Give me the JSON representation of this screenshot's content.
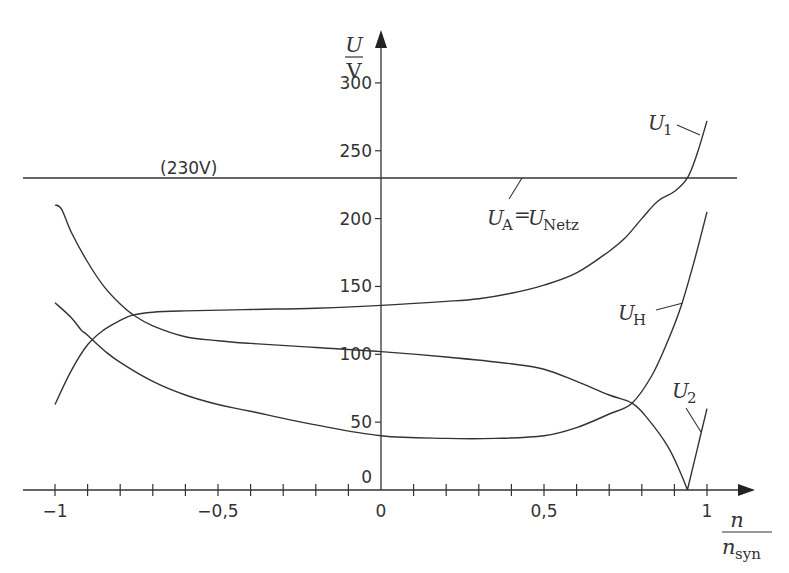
{
  "chart_data": {
    "type": "line",
    "title": "",
    "xlabel": {
      "numerator": "n",
      "denominator": "n",
      "denominator_sub": "syn"
    },
    "ylabel": {
      "numerator": "U",
      "denominator": "V"
    },
    "xlim": [
      -1.08,
      1.15
    ],
    "ylim": [
      0,
      320
    ],
    "grid": false,
    "x_ticks": [
      -1,
      -0.9,
      -0.8,
      -0.7,
      -0.6,
      -0.5,
      -0.4,
      -0.3,
      -0.2,
      -0.1,
      0,
      0.1,
      0.2,
      0.3,
      0.4,
      0.5,
      0.6,
      0.7,
      0.8,
      0.9,
      1
    ],
    "x_tick_labels": [
      {
        "value": -1,
        "label": "−1"
      },
      {
        "value": -0.5,
        "label": "−0,5"
      },
      {
        "value": 0,
        "label": "0"
      },
      {
        "value": 0.5,
        "label": "0,5"
      },
      {
        "value": 1,
        "label": "1"
      }
    ],
    "y_tick_labels": [
      {
        "value": 0,
        "label": "0"
      },
      {
        "value": 50,
        "label": "50"
      },
      {
        "value": 100,
        "label": "100"
      },
      {
        "value": 150,
        "label": "150"
      },
      {
        "value": 200,
        "label": "200"
      },
      {
        "value": 250,
        "label": "250"
      },
      {
        "value": 300,
        "label": "300"
      }
    ],
    "reference_line": {
      "y": 230,
      "label": "(230V)",
      "name": "U_A = U_Netz"
    },
    "series": [
      {
        "name": "U1",
        "label_main": "U",
        "label_sub": "1",
        "x": [
          -1.0,
          -0.95,
          -0.9,
          -0.85,
          -0.8,
          -0.76,
          -0.7,
          -0.6,
          -0.4,
          -0.2,
          0.0,
          0.2,
          0.3,
          0.4,
          0.5,
          0.6,
          0.7,
          0.75,
          0.8,
          0.85,
          0.9,
          0.94,
          0.97,
          1.0
        ],
        "y": [
          63,
          88,
          107,
          118,
          125,
          129,
          131,
          132,
          133,
          134,
          136,
          139,
          141,
          145,
          151,
          160,
          176,
          186,
          200,
          213,
          220,
          230,
          248,
          272
        ]
      },
      {
        "name": "U2",
        "label_main": "U",
        "label_sub": "2",
        "x": [
          -1.0,
          -0.98,
          -0.95,
          -0.9,
          -0.85,
          -0.8,
          -0.76,
          -0.7,
          -0.6,
          -0.5,
          -0.4,
          -0.2,
          0.0,
          0.2,
          0.4,
          0.5,
          0.6,
          0.7,
          0.77,
          0.82,
          0.88,
          0.92,
          0.94,
          0.97,
          1.0
        ],
        "y": [
          210,
          207,
          190,
          168,
          150,
          137,
          129,
          121,
          113,
          110,
          108,
          105,
          102,
          98,
          93,
          89,
          80,
          70,
          64,
          52,
          32,
          12,
          0,
          30,
          60
        ]
      },
      {
        "name": "UH",
        "label_main": "U",
        "label_sub": "H",
        "x": [
          -1.0,
          -0.95,
          -0.92,
          -0.9,
          -0.85,
          -0.8,
          -0.7,
          -0.6,
          -0.5,
          -0.4,
          -0.2,
          0.0,
          0.2,
          0.35,
          0.5,
          0.6,
          0.7,
          0.77,
          0.83,
          0.88,
          0.92,
          0.96,
          1.0
        ],
        "y": [
          138,
          127,
          118,
          114,
          103,
          94,
          80,
          70,
          63,
          58,
          48,
          40,
          38,
          38,
          40,
          46,
          56,
          64,
          84,
          110,
          135,
          168,
          205
        ]
      }
    ],
    "annotations": [
      {
        "text": "(230V)"
      },
      {
        "text_main": "U",
        "text_sub_a": "A",
        "equals": "=",
        "text_main2": "U",
        "text_sub_b": "Netz"
      },
      {
        "text": "U1"
      },
      {
        "text": "UH"
      },
      {
        "text": "U2"
      }
    ]
  },
  "labels": {
    "y_num": "U",
    "y_den": "V",
    "x_num": "n",
    "x_den": "n",
    "x_den_sub": "syn",
    "ref_value": "(230V)",
    "ua_main": "U",
    "ua_sub": "A",
    "ua_eq": "=",
    "unetz_main": "U",
    "unetz_sub": "Netz",
    "u1_main": "U",
    "u1_sub": "1",
    "uh_main": "U",
    "uh_sub": "H",
    "u2_main": "U",
    "u2_sub": "2"
  },
  "colors": {
    "line": "#333333",
    "text": "#333333",
    "background": "#ffffff"
  }
}
